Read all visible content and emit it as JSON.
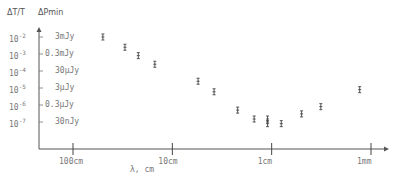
{
  "chart_data": {
    "type": "scatter",
    "title": "",
    "header_left": "ΔT/T",
    "header_right": "ΔPmin",
    "xlabel": "λ, cm",
    "ylabel": "ΔT/T",
    "x_scale": "log",
    "y_scale": "log",
    "x_direction": "decreasing wavelength to the right",
    "x_ticks": [
      "100cm",
      "10cm",
      "1cm",
      "1mm"
    ],
    "x_tick_values_cm": [
      100,
      10,
      1,
      0.1
    ],
    "y_ticks": [
      {
        "dT_T": "10^-2",
        "flux": "3mJy"
      },
      {
        "dT_T": "10^-3",
        "flux": "0.3mJy"
      },
      {
        "dT_T": "10^-4",
        "flux": "30μJy"
      },
      {
        "dT_T": "10^-5",
        "flux": "3μJy"
      },
      {
        "dT_T": "10^-6",
        "flux": "0.3μJy"
      },
      {
        "dT_T": "10^-7",
        "flux": "30nJy"
      }
    ],
    "ylim": [
      1e-08,
      0.01
    ],
    "grid": false,
    "legend": "none",
    "points": [
      {
        "lambda_cm": 50,
        "dT_T": 0.01
      },
      {
        "lambda_cm": 30,
        "dT_T": 0.0025
      },
      {
        "lambda_cm": 22,
        "dT_T": 0.0008
      },
      {
        "lambda_cm": 15,
        "dT_T": 0.00025
      },
      {
        "lambda_cm": 5.5,
        "dT_T": 2.5e-05
      },
      {
        "lambda_cm": 3.8,
        "dT_T": 6e-06
      },
      {
        "lambda_cm": 2.2,
        "dT_T": 5e-07
      },
      {
        "lambda_cm": 1.5,
        "dT_T": 1.5e-07
      },
      {
        "lambda_cm": 1.1,
        "dT_T": 1.5e-07
      },
      {
        "lambda_cm": 1.1,
        "dT_T": 8e-08
      },
      {
        "lambda_cm": 0.8,
        "dT_T": 8e-08
      },
      {
        "lambda_cm": 0.5,
        "dT_T": 3e-07
      },
      {
        "lambda_cm": 0.32,
        "dT_T": 8e-07
      },
      {
        "lambda_cm": 0.13,
        "dT_T": 8e-06
      }
    ]
  },
  "labels": {
    "header_left": "ΔT/T",
    "header_right": "ΔPmin",
    "xlabel": "λ, cm",
    "xticks": [
      "100cm",
      "10cm",
      "1cm",
      "1mm"
    ],
    "yexp": [
      "-2",
      "-3",
      "-4",
      "-5",
      "-6",
      "-7"
    ],
    "yflux": [
      "3mJy",
      "0.3mJy",
      "30μJy",
      "3μJy",
      "0.3μJy",
      "30nJy"
    ],
    "ybase": "10"
  }
}
